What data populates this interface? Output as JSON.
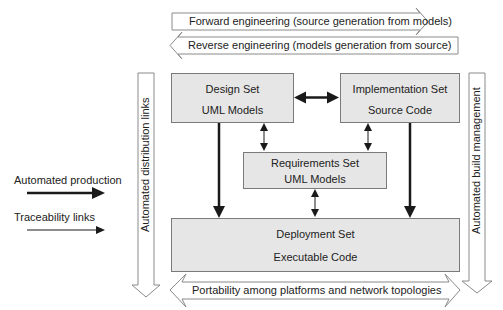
{
  "top_arrows": {
    "forward": "Forward engineering (source generation from models)",
    "reverse": "Reverse engineering (models generation from source)"
  },
  "side_arrows": {
    "left": "Automated distribution links",
    "right": "Automated build management"
  },
  "boxes": {
    "design": {
      "title": "Design Set",
      "subtitle": "UML Models"
    },
    "implementation": {
      "title": "Implementation Set",
      "subtitle": "Source Code"
    },
    "requirements": {
      "title": "Requirements Set",
      "subtitle": "UML Models"
    },
    "deployment": {
      "title": "Deployment Set",
      "subtitle": "Executable Code"
    }
  },
  "legend": {
    "automated_production": "Automated production",
    "traceability_links": "Traceability links"
  },
  "bottom_arrow": "Portability among platforms and network topologies",
  "colors": {
    "box_fill": "#e6e6e6",
    "box_border": "#7a7a7a",
    "arrow_outline": "#8a8a8a",
    "line": "#1a1a1a"
  }
}
